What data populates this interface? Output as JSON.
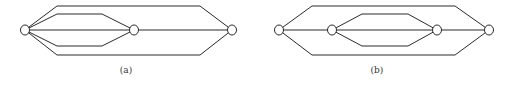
{
  "figures": [
    {
      "id": "a",
      "label": "(a)",
      "label_pos": [
        126,
        73
      ],
      "nodes": [
        {
          "name": "node-a1",
          "x": 25,
          "y": 30
        },
        {
          "name": "node-a2",
          "x": 134,
          "y": 30
        },
        {
          "name": "node-a3",
          "x": 232,
          "y": 30
        }
      ],
      "edges": [
        {
          "name": "edge-a-outer-top",
          "points": "25,30 57,6 200,6 232,30"
        },
        {
          "name": "edge-a-outer-bottom",
          "points": "25,30 57,55 200,55 232,30"
        },
        {
          "name": "edge-a-inner-top",
          "points": "25,30 57,14 102,14 134,30"
        },
        {
          "name": "edge-a-inner-bottom",
          "points": "25,30 57,46 102,46 134,30"
        },
        {
          "name": "edge-a-middle-left",
          "points": "25,30 134,30"
        },
        {
          "name": "edge-a-middle-right",
          "points": "134,30 232,30"
        }
      ]
    },
    {
      "id": "b",
      "label": "(b)",
      "label_pos": [
        377,
        73
      ],
      "nodes": [
        {
          "name": "node-b1",
          "x": 279,
          "y": 30
        },
        {
          "name": "node-b2",
          "x": 332,
          "y": 30
        },
        {
          "name": "node-b3",
          "x": 437,
          "y": 30
        },
        {
          "name": "node-b4",
          "x": 489,
          "y": 30
        }
      ],
      "edges": [
        {
          "name": "edge-b-outer-top",
          "points": "279,30 312,6 455,6 489,30"
        },
        {
          "name": "edge-b-outer-bottom",
          "points": "279,30 312,55 455,55 489,30"
        },
        {
          "name": "edge-b-inner-top",
          "points": "332,30 362,14 408,14 437,30"
        },
        {
          "name": "edge-b-inner-bottom",
          "points": "332,30 362,46 408,46 437,30"
        },
        {
          "name": "edge-b-middle-1",
          "points": "279,30 332,30"
        },
        {
          "name": "edge-b-middle-2",
          "points": "332,30 437,30"
        },
        {
          "name": "edge-b-middle-3",
          "points": "437,30 489,30"
        }
      ]
    }
  ],
  "node_radius": 4.5
}
